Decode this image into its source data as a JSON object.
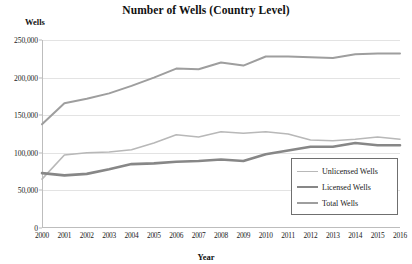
{
  "chart_data": {
    "type": "line",
    "title": "Number of Wells (Country Level)",
    "xlabel": "Year",
    "ylabel": "Wells",
    "ylim": [
      0,
      250000
    ],
    "yticks": [
      0,
      50000,
      100000,
      150000,
      200000,
      250000
    ],
    "ytick_labels": [
      "0",
      "50,000",
      "100,000",
      "150,000",
      "200,000",
      "250,000"
    ],
    "grid": true,
    "legend_position": "bottom-right",
    "categories": [
      2000,
      2001,
      2002,
      2003,
      2004,
      2005,
      2006,
      2007,
      2008,
      2009,
      2010,
      2011,
      2012,
      2013,
      2014,
      2015,
      2016
    ],
    "xtick_labels": [
      "2000",
      "2001",
      "2002",
      "2003",
      "2004",
      "2005",
      "2006",
      "2007",
      "2008",
      "2009",
      "2010",
      "2011",
      "2012",
      "2013",
      "2014",
      "2015",
      "2016"
    ],
    "series": [
      {
        "name": "Unlicensed Wells",
        "color": "#b8b8b8",
        "width": 1.6,
        "values": [
          65000,
          97000,
          100000,
          101000,
          104000,
          113000,
          124000,
          121000,
          128000,
          126000,
          128000,
          125000,
          117000,
          116000,
          118000,
          121000,
          118000
        ]
      },
      {
        "name": "Licensed Wells",
        "color": "#878787",
        "width": 2.6,
        "values": [
          73000,
          70000,
          72000,
          78000,
          85000,
          86000,
          88000,
          89000,
          91000,
          89000,
          98000,
          103000,
          108000,
          108000,
          113000,
          110000,
          110000
        ]
      },
      {
        "name": "Total Wells",
        "color": "#9e9e9e",
        "width": 2.0,
        "values": [
          138000,
          166000,
          172000,
          179000,
          189000,
          200000,
          212000,
          211000,
          220000,
          216000,
          228000,
          228000,
          227000,
          226000,
          231000,
          232000,
          232000
        ]
      }
    ]
  },
  "legend": {
    "items": [
      {
        "label": "Unlicensed Wells"
      },
      {
        "label": "Licensed Wells"
      },
      {
        "label": "Total Wells"
      }
    ]
  }
}
